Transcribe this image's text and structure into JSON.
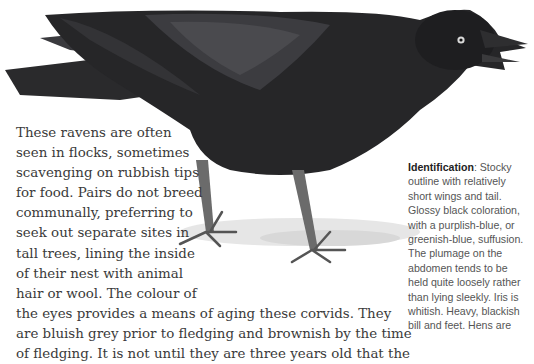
{
  "illustration": {
    "subject": "raven-illustration",
    "description": "Black raven standing on ground, beak open"
  },
  "main_text": {
    "lines": [
      "These ravens are often",
      "seen in flocks, sometimes",
      "scavenging on rubbish tips",
      "for food. Pairs do not breed",
      "communally, preferring to",
      "seek out separate sites in",
      "tall trees, lining the inside",
      "of their nest with animal",
      "hair or wool. The colour of",
      "the eyes provides a means of aging these corvids. They",
      "are bluish grey prior to fledging and brownish by the time",
      "of fledging. It is not until they are three years old that the"
    ]
  },
  "sidebar": {
    "heading": "Identification",
    "first_line_rest": ": Stocky",
    "lines": [
      "outline with relatively",
      "short wings and tail.",
      "Glossy black coloration,",
      "with a purplish-blue, or",
      "greenish-blue, suffusion.",
      "The plumage on the",
      "abdomen tends to be",
      "held quite loosely rather",
      "than lying sleekly. Iris is",
      "whitish. Heavy, blackish",
      "bill and feet. Hens are"
    ]
  }
}
